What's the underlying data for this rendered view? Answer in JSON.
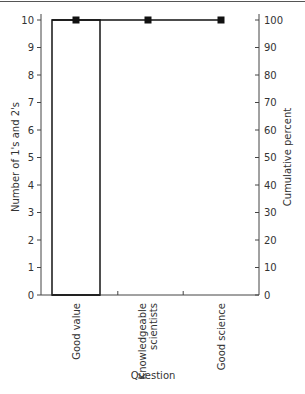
{
  "chart_data": {
    "type": "pareto",
    "title": "",
    "xlabel": "Question",
    "ylabel": "Number of 1's and 2's",
    "ylabel_right": "Cumulative percent",
    "categories": [
      "Good value",
      "Knowledgeable scientists",
      "Good science"
    ],
    "category_lines": [
      [
        "Good value"
      ],
      [
        "Knowledgeable",
        "scientists"
      ],
      [
        "Good science"
      ]
    ],
    "series": [
      {
        "name": "Number of 1's and 2's",
        "type": "bar",
        "axis": "left",
        "values": [
          10,
          0,
          0
        ]
      },
      {
        "name": "Cumulative percent",
        "type": "line",
        "axis": "right",
        "values": [
          100,
          100,
          100
        ]
      }
    ],
    "ylim": [
      0,
      10
    ],
    "ylim_right": [
      0,
      100
    ],
    "yticks": [
      0,
      1,
      2,
      3,
      4,
      5,
      6,
      7,
      8,
      9,
      10
    ],
    "yticks_right": [
      0,
      10,
      20,
      30,
      40,
      50,
      60,
      70,
      80,
      90,
      100
    ],
    "grid": false,
    "legend": null
  },
  "colors": {
    "axis": "#444444",
    "bar_edge": "#222222",
    "line": "#111111",
    "marker": "#111111"
  }
}
